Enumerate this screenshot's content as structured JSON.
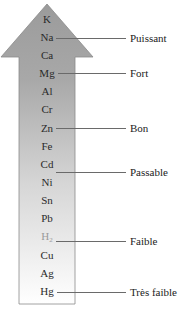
{
  "diagram": {
    "type": "reactivity-series-arrow",
    "arrow_direction": "up",
    "colors": {
      "arrow_top": "#9b9b9b",
      "arrow_bottom": "#ffffff",
      "arrow_border": "#8a8a8a",
      "connector": "#6a6a6a",
      "faded_text": "#9a9a9a"
    },
    "elements": [
      {
        "symbol": "K"
      },
      {
        "symbol": "Na"
      },
      {
        "symbol": "Ca"
      },
      {
        "symbol": "Mg"
      },
      {
        "symbol": "Al"
      },
      {
        "symbol": "Cr"
      },
      {
        "symbol": "Zn"
      },
      {
        "symbol": "Fe"
      },
      {
        "symbol": "Cd"
      },
      {
        "symbol": "Ni"
      },
      {
        "symbol": "Sn"
      },
      {
        "symbol": "Pb"
      },
      {
        "symbol": "H",
        "subscript": "2"
      },
      {
        "symbol": "Cu"
      },
      {
        "symbol": "Ag"
      },
      {
        "symbol": "Hg"
      },
      {
        "symbol": "Au"
      }
    ],
    "labels": [
      {
        "text": "Puissant",
        "element": "Na"
      },
      {
        "text": "Fort",
        "element": "Mg"
      },
      {
        "text": "Bon",
        "element": "Zn"
      },
      {
        "text": "Passable",
        "element": "Ni"
      },
      {
        "text": "Faible",
        "element": "Cu"
      },
      {
        "text": "Très faible",
        "element": "Au"
      }
    ]
  }
}
